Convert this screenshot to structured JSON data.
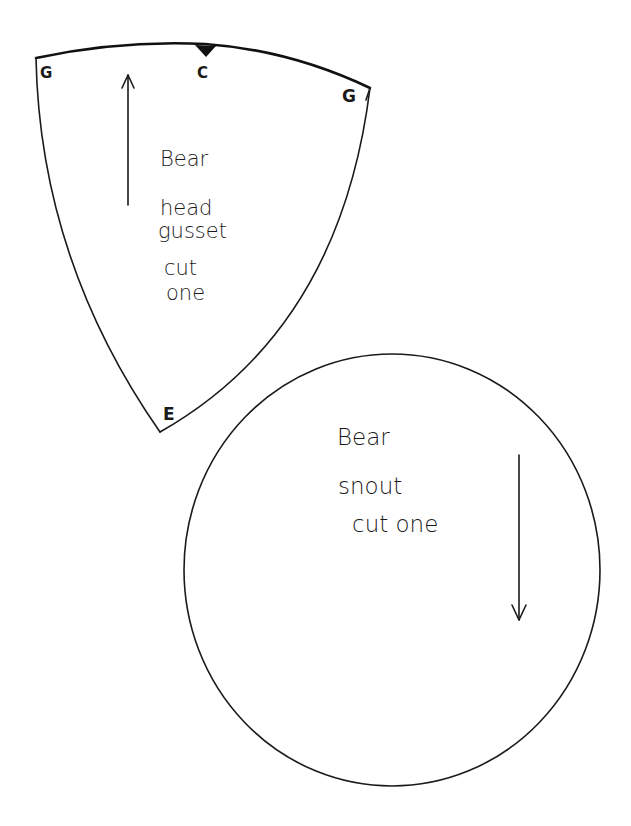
{
  "pattern": {
    "head_gusset": {
      "label_lines": [
        "Bear",
        "head",
        "gusset",
        "cut",
        "one"
      ],
      "marks": {
        "left_top": "G",
        "center_top": "C",
        "right_top": "G",
        "bottom": "E"
      },
      "grainline_direction": "up"
    },
    "snout": {
      "label_lines": [
        "Bear",
        "snout",
        "cut one"
      ],
      "grainline_direction": "down"
    }
  }
}
